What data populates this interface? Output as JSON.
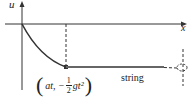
{
  "diagram": {
    "axis_labels": {
      "vertical": "u",
      "horizontal": "x"
    },
    "point_label": {
      "open": "(",
      "text": "at,  −",
      "frac_num": "1",
      "frac_den": "2",
      "tail": "gt²",
      "close": ")"
    },
    "string_label": "string",
    "colors": {
      "line": "#333333",
      "string": "#555555"
    }
  }
}
